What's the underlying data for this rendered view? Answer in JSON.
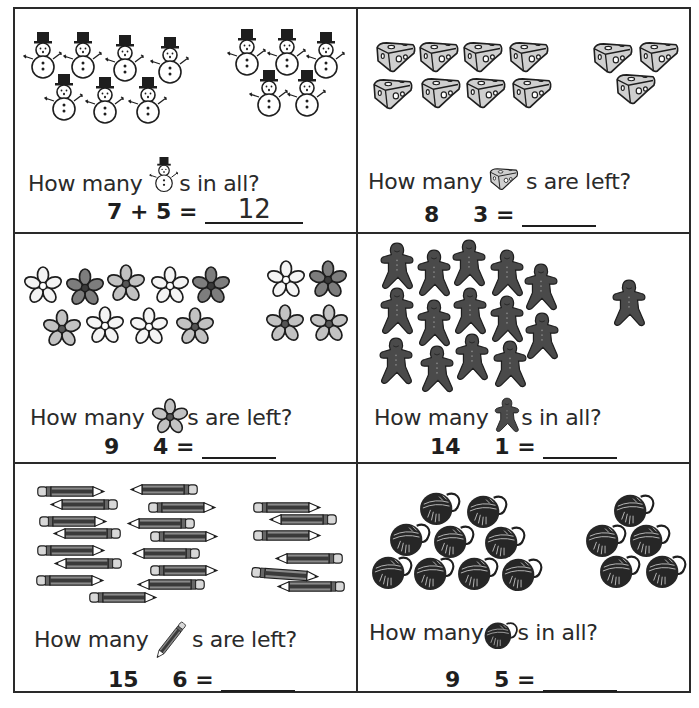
{
  "worksheet": {
    "problems": [
      {
        "id": "snowmen",
        "question_prefix": "How many",
        "question_suffix": "s in all?",
        "icon": "snowman-icon",
        "group_a_count": 7,
        "group_b_count": 5,
        "first": "7",
        "operator": "+",
        "second": "5",
        "equals": "=",
        "answer": "12"
      },
      {
        "id": "cheese",
        "question_prefix": "How many",
        "question_suffix": "s are left?",
        "icon": "cheese-icon",
        "group_a_count": 8,
        "group_b_count": 3,
        "first": "8",
        "operator": "",
        "second": "3",
        "equals": "=",
        "answer": ""
      },
      {
        "id": "flowers",
        "question_prefix": "How many",
        "question_suffix": "s are left?",
        "icon": "flower-icon",
        "group_a_count": 9,
        "group_b_count": 4,
        "first": "9",
        "operator": "",
        "second": "4",
        "equals": "=",
        "answer": ""
      },
      {
        "id": "gingerbread",
        "question_prefix": "How many",
        "question_suffix": "s in all?",
        "icon": "gingerbread-icon",
        "group_a_count": 14,
        "group_b_count": 1,
        "first": "14",
        "operator": "",
        "second": "1",
        "equals": "=",
        "answer": ""
      },
      {
        "id": "pencils",
        "question_prefix": "How many",
        "question_suffix": "s are left?",
        "icon": "pencil-icon",
        "group_a_count": 15,
        "group_b_count": 6,
        "first": "15",
        "operator": "",
        "second": "6",
        "equals": "=",
        "answer": ""
      },
      {
        "id": "yarn",
        "question_prefix": "How many",
        "question_suffix": "s in all?",
        "icon": "yarn-ball-icon",
        "group_a_count": 9,
        "group_b_count": 5,
        "first": "9",
        "operator": "",
        "second": "5",
        "equals": "=",
        "answer": ""
      }
    ]
  },
  "colors": {
    "ink": "#2a2a2a",
    "cheese_fill": "#cfcfcf",
    "flower_light": "#e4e4e4",
    "flower_mid": "#b9b9b9",
    "flower_dark": "#7d7d7d",
    "gingerbread_fill": "#4a4a4a",
    "yarn_fill": "#262626"
  }
}
